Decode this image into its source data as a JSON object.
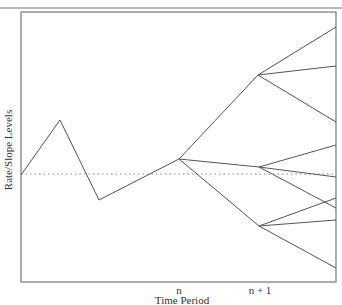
{
  "diagram": {
    "type": "interest-rate-tree",
    "y_axis_label": "Rate/Slope Levels",
    "x_axis_label": "Time Period",
    "x_ticks": [
      {
        "label": "n",
        "x": 179
      },
      {
        "label": "n + 1",
        "x": 260
      }
    ],
    "frame": {
      "left": 21,
      "top": 12,
      "right": 336,
      "bottom": 282
    },
    "top_rule_y": 8,
    "baseline_dotted_y": 174,
    "history_path": [
      [
        21,
        175
      ],
      [
        60,
        120
      ],
      [
        99,
        200
      ],
      [
        179,
        159
      ]
    ],
    "node_n": [
      179,
      159
    ],
    "nodes_n_plus_1": [
      [
        258,
        75
      ],
      [
        259,
        167
      ],
      [
        259,
        226
      ]
    ],
    "branches_from_n_plus_1": [
      {
        "from": [
          258,
          75
        ],
        "to": [
          [
            336,
            27
          ],
          [
            336,
            66
          ],
          [
            336,
            122
          ]
        ]
      },
      {
        "from": [
          259,
          167
        ],
        "to": [
          [
            336,
            145
          ],
          [
            336,
            177
          ],
          [
            336,
            208
          ]
        ]
      },
      {
        "from": [
          259,
          226
        ],
        "to": [
          [
            336,
            198
          ],
          [
            336,
            220
          ],
          [
            336,
            268
          ]
        ]
      }
    ],
    "line_color": "#555555",
    "frame_color": "#777777",
    "dotted_color": "#888888"
  }
}
